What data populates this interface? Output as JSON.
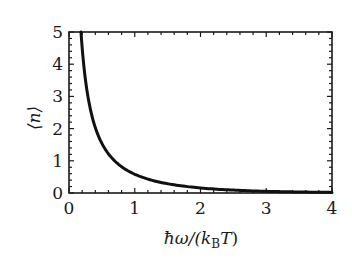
{
  "chart_data": {
    "type": "line",
    "title": "",
    "xlabel": "ħω/(k_B T)",
    "ylabel": "⟨n⟩",
    "xlim": [
      0,
      4
    ],
    "ylim": [
      0,
      5
    ],
    "x_ticks": [
      0,
      1,
      2,
      3,
      4
    ],
    "y_ticks": [
      0,
      1,
      2,
      3,
      4,
      5
    ],
    "x_tick_labels": [
      "0",
      "1",
      "2",
      "3",
      "4"
    ],
    "y_tick_labels": [
      "0",
      "1",
      "2",
      "3",
      "4",
      "5"
    ],
    "minor_tick_step": 0.2,
    "grid": false,
    "legend": null,
    "series": [
      {
        "name": "⟨n⟩ = 1/(e^x − 1)",
        "color": "#111111",
        "x": [
          0.1823,
          0.2,
          0.225,
          0.25,
          0.275,
          0.3,
          0.35,
          0.4,
          0.45,
          0.5,
          0.6,
          0.7,
          0.8,
          0.9,
          1.0,
          1.2,
          1.4,
          1.6,
          1.8,
          2.0,
          2.25,
          2.5,
          2.75,
          3.0,
          3.25,
          3.5,
          3.75,
          4.0
        ],
        "y": [
          5.0,
          4.517,
          3.969,
          3.521,
          3.164,
          2.858,
          2.381,
          2.033,
          1.762,
          1.541,
          1.216,
          0.986,
          0.816,
          0.686,
          0.582,
          0.431,
          0.328,
          0.253,
          0.198,
          0.157,
          0.118,
          0.089,
          0.068,
          0.052,
          0.04,
          0.031,
          0.024,
          0.019
        ]
      }
    ]
  },
  "labels": {
    "xlabel_hbar": "ħω/(",
    "xlabel_k": "k",
    "xlabel_sub": "B",
    "xlabel_T": "T",
    "xlabel_close": ")",
    "ylabel": "⟨n⟩"
  }
}
